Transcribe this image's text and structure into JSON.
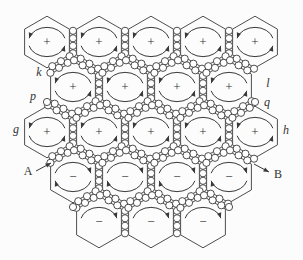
{
  "figure": {
    "width": 303,
    "height": 260
  },
  "colors": {
    "background": "#fcfcfc",
    "line": "#3a3a3a",
    "grain_fill": "#ffffff",
    "text": "#333333"
  },
  "lattice": {
    "hex_spacing": 52,
    "hex_half_width": 26,
    "hex_side": 30,
    "inset": 3.6,
    "circle_radius": 3.6,
    "arc_rx": 18.5,
    "arc_ry": 14.5,
    "verticals_per_edge": 4,
    "zigzag_per_edge": 6,
    "zigzag_offset": 2.4,
    "rows": [
      {
        "count": 5,
        "x0": 47,
        "y": 42,
        "sign": "+",
        "rotation": "ccw",
        "arcs": "both"
      },
      {
        "count": 4,
        "x0": 73,
        "y": 87,
        "sign": "+",
        "rotation": "ccw",
        "arcs": "both"
      },
      {
        "count": 5,
        "x0": 47,
        "y": 132,
        "sign": "+",
        "rotation": "ccw",
        "arcs": "both"
      },
      {
        "count": 4,
        "x0": 73,
        "y": 177,
        "sign": "−",
        "rotation": "cw",
        "arcs": "both"
      },
      {
        "count": 3,
        "x0": 99,
        "y": 222,
        "sign": "−",
        "rotation": "cw",
        "arcs": "top"
      }
    ],
    "lone_circles": [
      [
        47,
        102
      ],
      [
        255,
        102
      ],
      [
        73,
        207
      ],
      [
        229,
        207
      ]
    ]
  },
  "side_labels": [
    {
      "text": "k",
      "x": 39,
      "y": 76
    },
    {
      "text": "p",
      "x": 33,
      "y": 100
    },
    {
      "text": "l",
      "x": 268,
      "y": 87
    },
    {
      "text": "q",
      "x": 267,
      "y": 106
    },
    {
      "text": "g",
      "x": 16,
      "y": 133
    },
    {
      "text": "h",
      "x": 286,
      "y": 134
    }
  ],
  "annotations": [
    {
      "text": "A",
      "x": 28,
      "y": 175,
      "arrow": [
        36,
        171,
        51,
        163
      ]
    },
    {
      "text": "B",
      "x": 278,
      "y": 178,
      "arrow": [
        254,
        164,
        269,
        172
      ]
    }
  ]
}
